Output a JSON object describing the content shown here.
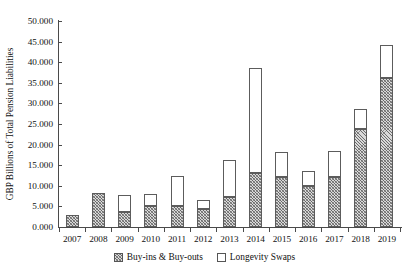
{
  "chart_data": {
    "type": "bar",
    "stacked": true,
    "title": "",
    "subtitle": "",
    "xlabel": "",
    "ylabel": "GBP Billions of Total Pension Liabilities",
    "categories": [
      "2007",
      "2008",
      "2009",
      "2010",
      "2011",
      "2012",
      "2013",
      "2014",
      "2015",
      "2016",
      "2017",
      "2018",
      "2019"
    ],
    "series": [
      {
        "name": "Buy-ins & Buy-outs",
        "values": [
          3.0,
          8.3,
          3.6,
          5.2,
          5.2,
          4.4,
          7.2,
          13.1,
          12.1,
          9.9,
          12.1,
          23.8,
          36.1
        ]
      },
      {
        "name": "Longevity Swaps",
        "values": [
          0.0,
          0.0,
          4.1,
          2.8,
          7.1,
          2.1,
          9.0,
          25.4,
          6.0,
          3.6,
          6.4,
          4.8,
          8.0
        ]
      }
    ],
    "totals": [
      3.0,
      8.3,
      7.7,
      8.0,
      12.3,
      6.5,
      16.2,
      38.5,
      18.1,
      13.5,
      18.5,
      28.6,
      44.1
    ],
    "ylim": [
      0,
      50
    ],
    "ytick_step": 5,
    "ytick_labels": [
      "0.000",
      "5.000",
      "10.000",
      "15.000",
      "20.000",
      "25.000",
      "30.000",
      "35.000",
      "40.000",
      "45.000",
      "50.000"
    ],
    "ytick_values": [
      0,
      5,
      10,
      15,
      20,
      25,
      30,
      35,
      40,
      45,
      50
    ],
    "grid": false,
    "legend_position": "bottom",
    "colors": {
      "buy_ins_fill": "#d9d9d9",
      "buy_ins_hatch": "#5a5a5a",
      "longevity_fill": "#ffffff",
      "outline": "#5c5c5c",
      "axis": "#4a4a4a",
      "text": "#111111"
    }
  },
  "legend": {
    "items": [
      {
        "label": "Buy-ins & Buy-outs",
        "swatch": "hatched-square-icon"
      },
      {
        "label": "Longevity Swaps",
        "swatch": "empty-square-icon"
      }
    ]
  }
}
